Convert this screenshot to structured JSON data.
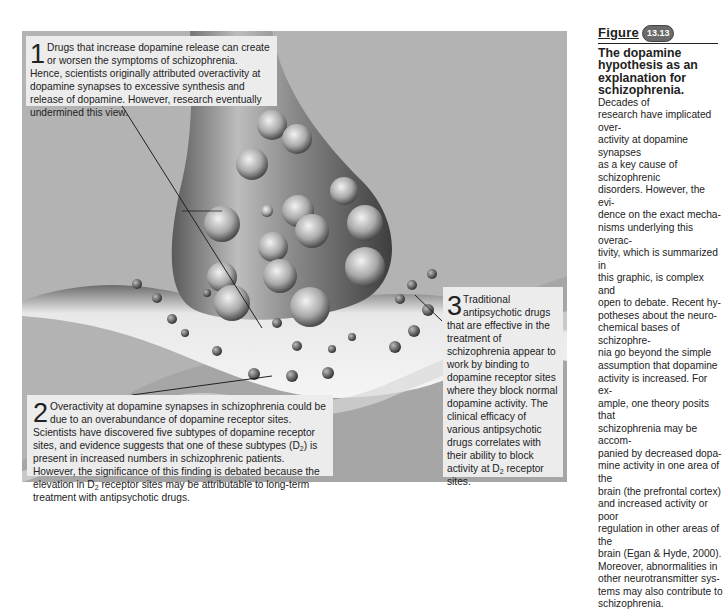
{
  "figure": {
    "label": "Figure",
    "number": "13.13",
    "title": "The dopamine hypothesis as an explanation for schizophrenia.",
    "caption_lines": [
      "Decades of",
      "research have implicated over-",
      "activity at dopamine synapses",
      "as a key cause of schizophrenic",
      "disorders. However, the evi-",
      "dence on the exact mecha-",
      "nisms underlying this overac-",
      "tivity, which is summarized in",
      "this graphic, is complex and",
      "open to debate. Recent hy-",
      "potheses about the neuro-",
      "chemical bases of schizophre-",
      "nia go beyond the simple",
      "assumption that dopamine",
      "activity is increased. For ex-",
      "ample, one theory posits that",
      "schizophrenia may be accom-",
      "panied by decreased dopa-",
      "mine activity in one area of the",
      "brain (the prefrontal cortex)",
      "and increased activity or poor",
      "regulation in other areas of the",
      "brain (Egan & Hyde, 2000).",
      "Moreover, abnormalities in",
      "other neurotransmitter sys-",
      "tems may also contribute to",
      "schizophrenia."
    ]
  },
  "callouts": [
    {
      "number": "1",
      "text": "Drugs that increase dopamine release can create or worsen the symptoms of schizophrenia. Hence, scientists originally attributed overactivity at dopamine synapses to excessive synthesis and release of dopamine. However, research eventually undermined this view."
    },
    {
      "number": "2",
      "text_a": "Overactivity at dopamine synapses in schizophrenia could be due to an overabundance of dopamine receptor sites. Scientists have discovered five subtypes of dopamine receptor sites, and evidence suggests that one of these subtypes (D",
      "sub_a": "2",
      "text_b": ") is present in increased numbers in schizophrenic patients. However, the significance of this finding is debated because the elevation in D",
      "sub_b": "2",
      "text_c": " receptor sites may be attributable to long-term treatment with antipsychotic drugs."
    },
    {
      "number": "3",
      "text_a": "Traditional antipsychotic drugs that are effective in the treatment of schizophrenia appear to work by binding to dopamine receptor sites where they block normal dopamine activity. The clinical efficacy of various antipsychotic drugs correlates with their ability to block activity at D",
      "sub_a": "2",
      "text_b": " receptor sites."
    }
  ],
  "illustration": {
    "subject": "dopamine synapse: presynaptic terminal with vesicles, synaptic cleft, postsynaptic membrane with receptor sites",
    "colors": {
      "background": "#b3b3b3",
      "callout_bg": "#ececec",
      "badge": "#6a6a6a"
    }
  }
}
